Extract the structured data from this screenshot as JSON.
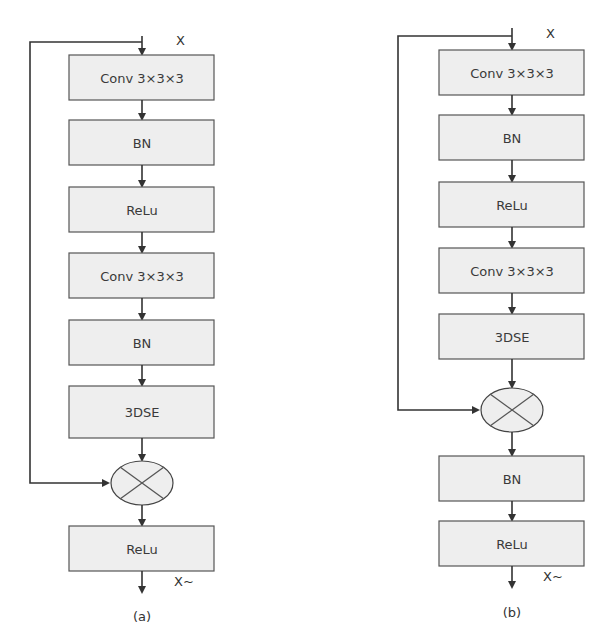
{
  "diagram_a": {
    "caption": "(a)",
    "input_label": "X",
    "output_label": "X~",
    "blocks": [
      {
        "label": "Conv 3×3×3"
      },
      {
        "label": "BN"
      },
      {
        "label": "ReLu"
      },
      {
        "label": "Conv 3×3×3"
      },
      {
        "label": "BN"
      },
      {
        "label": "3DSE"
      },
      {
        "label": "ReLu"
      }
    ],
    "merge_op": "multiply-icon"
  },
  "diagram_b": {
    "caption": "(b)",
    "input_label": "X",
    "output_label": "X~",
    "blocks": [
      {
        "label": "Conv 3×3×3"
      },
      {
        "label": "BN"
      },
      {
        "label": "ReLu"
      },
      {
        "label": "Conv 3×3×3"
      },
      {
        "label": "3DSE"
      },
      {
        "label": "BN"
      },
      {
        "label": "ReLu"
      }
    ],
    "merge_op": "multiply-icon"
  },
  "colors": {
    "block_fill": "#eeeeee",
    "block_stroke": "#555555",
    "line": "#333333"
  }
}
